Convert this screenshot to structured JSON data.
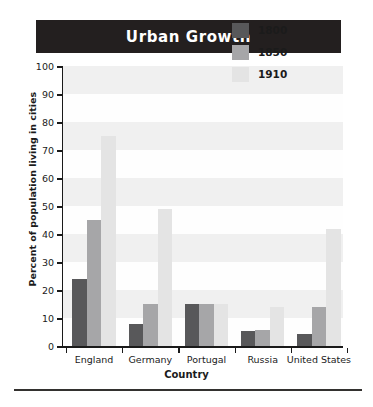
{
  "title": "Urban Growth",
  "chart_data": {
    "type": "bar",
    "title": "Urban Growth",
    "xlabel": "Country",
    "ylabel": "Percent of population living in cities",
    "ylim": [
      0,
      100
    ],
    "ytick_labels": [
      "0",
      "10",
      "20",
      "30",
      "40",
      "50",
      "60",
      "70",
      "80",
      "90",
      "100"
    ],
    "yticks": [
      0,
      10,
      20,
      30,
      40,
      50,
      60,
      70,
      80,
      90,
      100
    ],
    "grid": false,
    "legend_position": "top-right",
    "categories": [
      "England",
      "Germany",
      "Portugal",
      "Russia",
      "United States"
    ],
    "series": [
      {
        "name": "1800",
        "color": "#58585a",
        "values": [
          24,
          8,
          15,
          5.5,
          4.5
        ]
      },
      {
        "name": "1850",
        "color": "#a6a6a8",
        "values": [
          45,
          15,
          15,
          6,
          14
        ]
      },
      {
        "name": "1910",
        "color": "#e4e4e4",
        "values": [
          75,
          49,
          15,
          14,
          42
        ]
      }
    ]
  }
}
